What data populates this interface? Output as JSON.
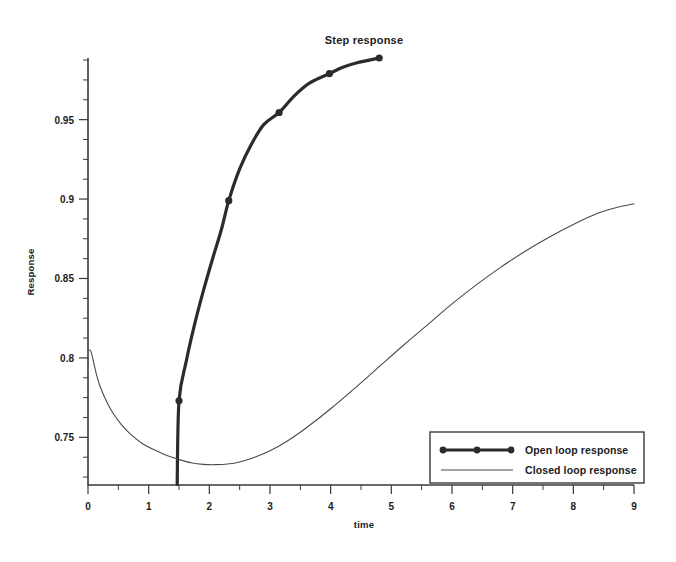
{
  "chart_data": {
    "type": "line",
    "title": "Step response",
    "xlabel": "time",
    "ylabel": "Response",
    "xlim": [
      0,
      9
    ],
    "ylim": [
      0.72,
      0.9888
    ],
    "grid": false,
    "legend_position": "lower right",
    "x_ticks": [
      0,
      1,
      2,
      3,
      4,
      5,
      6,
      7,
      8,
      9
    ],
    "x_tick_labels": [
      "0",
      "1",
      "2",
      "3",
      "4",
      "5",
      "6",
      "7",
      "8",
      "9"
    ],
    "x_minor_step": 0.5,
    "y_ticks": [
      0.75,
      0.8,
      0.85,
      0.9,
      0.95
    ],
    "y_tick_labels": [
      "0.75",
      "0.8",
      "0.85",
      "0.9",
      "0.95"
    ],
    "y_minor_step": 0.0125,
    "series": [
      {
        "name": "Open loop response",
        "style": "thick-with-markers",
        "color": "#2b2b2b",
        "markers": true,
        "x": [
          1.47,
          1.5,
          1.62,
          1.75,
          1.9,
          2.05,
          2.2,
          2.32,
          2.5,
          2.7,
          2.9,
          3.15,
          3.4,
          3.65,
          3.98,
          4.2,
          4.45,
          4.8
        ],
        "y": [
          0.7205,
          0.773,
          0.798,
          0.82,
          0.842,
          0.862,
          0.881,
          0.899,
          0.919,
          0.935,
          0.947,
          0.9545,
          0.965,
          0.973,
          0.979,
          0.983,
          0.986,
          0.9888
        ],
        "marker_points": [
          {
            "x": 1.5,
            "y": 0.773
          },
          {
            "x": 2.32,
            "y": 0.899
          },
          {
            "x": 3.15,
            "y": 0.9545
          },
          {
            "x": 3.98,
            "y": 0.979
          },
          {
            "x": 4.8,
            "y": 0.9888
          }
        ]
      },
      {
        "name": "Closed loop response",
        "style": "thin",
        "color": "#4a4a4a",
        "markers": false,
        "x": [
          0.02,
          0.05,
          0.1,
          0.15,
          0.2,
          0.3,
          0.4,
          0.55,
          0.7,
          0.9,
          1.1,
          1.3,
          1.5,
          1.7,
          1.9,
          2.1,
          2.3,
          2.5,
          2.75,
          3.0,
          3.3,
          3.6,
          4.0,
          4.4,
          4.8,
          5.2,
          5.6,
          6.0,
          6.4,
          6.8,
          7.2,
          7.6,
          8.0,
          8.4,
          8.7,
          9.0
        ],
        "y": [
          0.805,
          0.804,
          0.796,
          0.788,
          0.782,
          0.773,
          0.766,
          0.758,
          0.752,
          0.746,
          0.742,
          0.7385,
          0.736,
          0.734,
          0.733,
          0.7328,
          0.7332,
          0.7345,
          0.7375,
          0.7415,
          0.748,
          0.756,
          0.768,
          0.781,
          0.7945,
          0.808,
          0.821,
          0.834,
          0.846,
          0.857,
          0.867,
          0.876,
          0.884,
          0.891,
          0.8945,
          0.897
        ]
      }
    ]
  },
  "legend": {
    "entries": [
      {
        "label": "Open loop response"
      },
      {
        "label": "Closed loop response"
      }
    ]
  }
}
